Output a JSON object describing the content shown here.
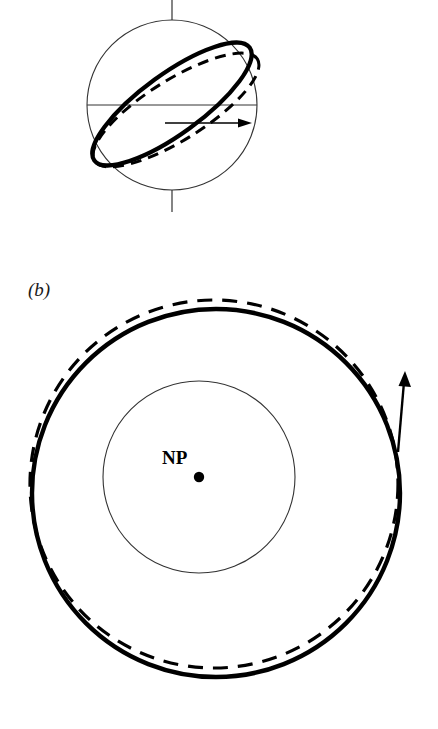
{
  "figure": {
    "background_color": "#ffffff",
    "ink_color": "#000000",
    "width": 438,
    "height": 729,
    "panels": [
      {
        "id": "panel-a",
        "label": "",
        "caption": "",
        "description": "sphere with rotation axis, equator, and two tilted orbital rings"
      },
      {
        "id": "panel-b",
        "label": "(b)",
        "caption": "",
        "description": "polar view: inner circle, solid outer orbit circle and offset dashed orbit circle with tangential motion arrow"
      }
    ]
  },
  "panel_a": {
    "sphere": {
      "name": "planet-sphere",
      "center_x": 172,
      "center_y": 105,
      "radius": 85,
      "stroke_width": 1.1,
      "stroke_color": "#333333"
    },
    "rotation_axis": {
      "name": "rotation-axis",
      "x": 172,
      "y_top": 0,
      "y_bottom": 212,
      "stroke_width": 1.2,
      "stroke_color": "#333333"
    },
    "equator": {
      "name": "equator-line",
      "y": 105,
      "x_left": 87,
      "x_right": 257,
      "stroke_width": 1.0,
      "stroke_color": "#333333"
    },
    "ring_solid": {
      "name": "orbit-ring-solid",
      "center_x": 172,
      "center_y": 104,
      "rx": 96,
      "ry": 30,
      "rotation_deg": -36,
      "stroke_width": 4.2,
      "stroke_color": "#000000",
      "style": "solid"
    },
    "ring_dashed": {
      "name": "orbit-ring-dashed",
      "center_x": 176,
      "center_y": 110,
      "rx": 96,
      "ry": 30,
      "rotation_deg": -32,
      "stroke_width": 3.0,
      "stroke_color": "#000000",
      "style": "dashed",
      "dash_pattern": "11 7"
    },
    "motion_arrow": {
      "name": "motion-arrow",
      "x_start": 165,
      "x_end": 250,
      "y": 123,
      "stroke_width": 1.6,
      "stroke_color": "#000000",
      "direction": "right"
    }
  },
  "panel_b": {
    "label": "(b)",
    "pole_label": "NP",
    "pole_marker": {
      "name": "north-pole-dot",
      "center_x": 199,
      "center_y": 477,
      "radius": 5.2,
      "fill": "#000000"
    },
    "inner_circle": {
      "name": "inner-latitude-circle",
      "center_x": 199,
      "center_y": 477,
      "radius": 96,
      "stroke_width": 1.1,
      "stroke_color": "#333333",
      "style": "solid"
    },
    "outer_circle_solid": {
      "name": "orbit-circle-solid",
      "center_x": 216,
      "center_y": 493,
      "radius": 184,
      "stroke_width": 4.4,
      "stroke_color": "#000000",
      "style": "solid"
    },
    "outer_circle_dashed": {
      "name": "orbit-circle-dashed",
      "center_x": 214,
      "center_y": 484,
      "radius": 184,
      "stroke_width": 3.2,
      "stroke_color": "#000000",
      "style": "dashed",
      "dash_pattern": "15 10"
    },
    "motion_arrow": {
      "name": "motion-arrow",
      "x_start": 398,
      "y_start": 450,
      "x_end": 406,
      "y_end": 371,
      "stroke_width": 2.4,
      "stroke_color": "#000000",
      "direction": "up"
    }
  }
}
